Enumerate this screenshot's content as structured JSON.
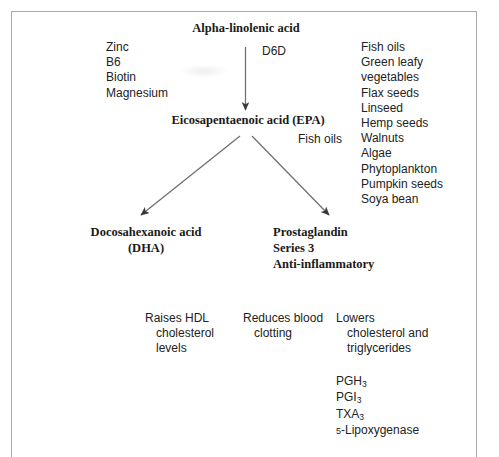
{
  "diagram": {
    "title_node": "Alpha-linolenic acid",
    "enzyme_label": "D6D",
    "epa_node": "Eicosapentaenoic acid (EPA)",
    "epa_source_label": "Fish oils",
    "dha_node": "Docosahexanoic acid\n(DHA)",
    "prostaglandin_node": "Prostaglandin\nSeries 3\nAnti-inflammatory"
  },
  "cofactors": {
    "items": "Zinc\nB6\nBiotin\nMagnesium"
  },
  "food_sources": {
    "line1": "Fish oils",
    "line2": "Green leafy\n  vegetables",
    "line3": "Flax seeds",
    "line4": "Linseed",
    "line5": "Hemp seeds",
    "line6": "Walnuts",
    "line7": "Algae",
    "line8": "Phytoplankton",
    "line9": "Pumpkin seeds",
    "line10": "Soya bean"
  },
  "benefits": {
    "dha_effect": "Raises HDL\ncholesterol\nlevels",
    "clotting_effect": "Reduces blood\nclotting",
    "cholesterol_effect": "Lowers\ncholesterol and\ntriglycerides"
  },
  "mediators": {
    "pgh": {
      "name": "PGH",
      "subscript": "3"
    },
    "pgi": {
      "name": "PGI",
      "subscript": "3"
    },
    "txa": {
      "name": "TXA",
      "subscript": "3"
    },
    "lipoxygenase": {
      "prefix": "5",
      "name": "-Lipoxygenase"
    }
  },
  "style": {
    "arrow_color": "#3a3a3a",
    "frame_color": "#a8a8a8",
    "text_color": "#1a1a1a"
  }
}
